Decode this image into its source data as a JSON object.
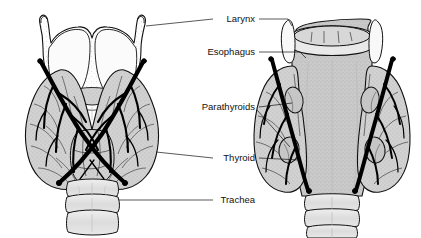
{
  "figure": {
    "background_color": "#ffffff",
    "ink_color": "#111111",
    "gland_fill": "#cfcfcf",
    "cartilage_fill": "#fdfdfd",
    "vessel_color": "#000000",
    "esophagus_fill": "#c8c8c8"
  },
  "labels": [
    {
      "id": "larynx",
      "text": "Larynx",
      "x": 255,
      "y": 22,
      "anchor": "end"
    },
    {
      "id": "esophagus",
      "text": "Esophagus",
      "x": 255,
      "y": 55,
      "anchor": "end"
    },
    {
      "id": "parathyroids",
      "text": "Parathyroids",
      "x": 255,
      "y": 110,
      "anchor": "end"
    },
    {
      "id": "thyroid",
      "text": "Thyroid",
      "x": 255,
      "y": 161,
      "anchor": "end"
    },
    {
      "id": "trachea",
      "text": "Trachea",
      "x": 255,
      "y": 203,
      "anchor": "end"
    }
  ],
  "views": [
    {
      "id": "anterior-view",
      "side": "left",
      "structures": [
        "thyroid cartilage",
        "thyroid gland lobes",
        "isthmus",
        "arteries",
        "tracheal rings"
      ]
    },
    {
      "id": "posterior-view",
      "side": "right",
      "structures": [
        "esophagus",
        "thyroid gland lobes",
        "parathyroid glands",
        "arteries",
        "tracheal rings"
      ]
    }
  ]
}
